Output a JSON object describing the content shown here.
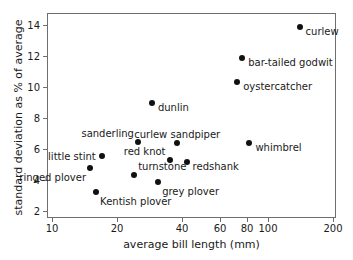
{
  "chart_data": {
    "type": "scatter",
    "title": "",
    "xlabel": "average bill length (mm)",
    "ylabel": "standard deviation as % of average",
    "xscale": "log",
    "yscale": "linear",
    "xlim": [
      9.0,
      230
    ],
    "ylim": [
      1.6,
      14.6
    ],
    "xticks": [
      10,
      20,
      40,
      60,
      80,
      100,
      200
    ],
    "xticklabels": [
      "10",
      "20",
      "40",
      "60",
      "80",
      "100",
      "200"
    ],
    "yticks": [
      2,
      4,
      6,
      8,
      10,
      12,
      14
    ],
    "yticklabels": [
      "2",
      "4",
      "6",
      "8",
      "10",
      "12",
      "14"
    ],
    "grid": false,
    "legend": "none",
    "marker_color": "#111111",
    "axis_color": "#6e6e6e",
    "points": [
      {
        "label": "curlew",
        "x": 140,
        "y": 13.9,
        "label_pos": "right"
      },
      {
        "label": "bar-tailed godwit",
        "x": 76,
        "y": 11.9,
        "label_pos": "right"
      },
      {
        "label": "oystercatcher",
        "x": 72,
        "y": 10.3,
        "label_pos": "right"
      },
      {
        "label": "dunlin",
        "x": 29,
        "y": 9.0,
        "label_pos": "right"
      },
      {
        "label": "whimbrel",
        "x": 82,
        "y": 6.4,
        "label_pos": "right"
      },
      {
        "label": "curlew sandpiper",
        "x": 38,
        "y": 6.4,
        "label_pos": "above"
      },
      {
        "label": "sanderling",
        "x": 25,
        "y": 6.45,
        "label_pos": "above-left"
      },
      {
        "label": "little stint",
        "x": 17,
        "y": 5.55,
        "label_pos": "left"
      },
      {
        "label": "red knot",
        "x": 35,
        "y": 5.3,
        "label_pos": "above-left"
      },
      {
        "label": "redshank",
        "x": 42,
        "y": 5.15,
        "label_pos": "right"
      },
      {
        "label": "ringed plover",
        "x": 15,
        "y": 4.75,
        "label_pos": "below-left"
      },
      {
        "label": "turnstone",
        "x": 24,
        "y": 4.3,
        "label_pos": "above-right"
      },
      {
        "label": "grey plover",
        "x": 31,
        "y": 3.85,
        "label_pos": "below-right"
      },
      {
        "label": "Kentish plover",
        "x": 16,
        "y": 3.25,
        "label_pos": "below-right"
      }
    ]
  }
}
